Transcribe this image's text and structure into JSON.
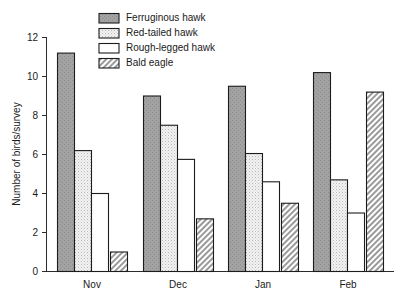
{
  "chart_data": {
    "type": "bar",
    "title": "",
    "subtitle": "",
    "xlabel": "",
    "ylabel": "Number of birds/survey",
    "categories": [
      "Nov",
      "Dec",
      "Jan",
      "Feb"
    ],
    "ylim": [
      0,
      12
    ],
    "yticks": [
      0,
      2,
      4,
      6,
      8,
      10,
      12
    ],
    "ytick_labels": [
      "0",
      "2",
      "4",
      "6",
      "8",
      "10",
      "12"
    ],
    "grid": false,
    "legend_position": "top-center",
    "series": [
      {
        "name": "Ferruginous hawk",
        "fill": "solid-gray",
        "color": "#9d9d9d",
        "values": [
          11.2,
          9.0,
          9.5,
          10.2
        ]
      },
      {
        "name": "Red-tailed hawk",
        "fill": "dotted-light",
        "color": "#ededed",
        "values": [
          6.2,
          7.5,
          6.05,
          4.7
        ]
      },
      {
        "name": "Rough-legged hawk",
        "fill": "white",
        "color": "#ffffff",
        "values": [
          4.0,
          5.75,
          4.6,
          3.0
        ]
      },
      {
        "name": "Bald eagle",
        "fill": "diagonal-hatch",
        "color": "#c8c8c8",
        "values": [
          1.0,
          2.7,
          3.5,
          9.2
        ]
      }
    ]
  },
  "legend": {
    "items": [
      {
        "label": "Ferruginous hawk"
      },
      {
        "label": "Red-tailed hawk"
      },
      {
        "label": "Rough-legged hawk"
      },
      {
        "label": "Bald eagle"
      }
    ]
  },
  "axes": {
    "y_title": "Number of birds/survey",
    "y_tick_labels": [
      "12",
      "10",
      "8",
      "6",
      "4",
      "2",
      "0"
    ],
    "x_tick_labels": [
      "Nov",
      "Dec",
      "Jan",
      "Feb"
    ]
  },
  "colors": {
    "axis": "#2b2b2b",
    "bar_outline": "#1c1c1c",
    "series_1": "#9d9d9d",
    "series_2": "#ededed",
    "series_3": "#ffffff",
    "series_4": "#c8c8c8",
    "background": "#ffffff"
  }
}
